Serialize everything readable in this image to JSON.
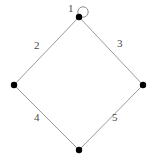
{
  "diagram": {
    "type": "graph",
    "title": "",
    "background_color": "#ffffff",
    "vertex_color": "#000000",
    "edge_color": "#9a9a9a",
    "label_color": "#4a4a4a",
    "shape": "diamond",
    "vertices": [
      {
        "id": "top",
        "name": "vertex-top",
        "x": 79,
        "y": 17,
        "radius": 3.2
      },
      {
        "id": "left",
        "name": "vertex-left",
        "x": 14,
        "y": 85,
        "radius": 3.2
      },
      {
        "id": "right",
        "name": "vertex-right",
        "x": 143,
        "y": 85,
        "radius": 3.2
      },
      {
        "id": "bottom",
        "name": "vertex-bottom",
        "x": 79,
        "y": 150,
        "radius": 3.2
      }
    ],
    "edges": [
      {
        "id": "e1",
        "name": "edge-self-loop-top",
        "from": "top",
        "to": "top",
        "kind": "loop",
        "cx": 83,
        "cy": 12,
        "r": 5.2
      },
      {
        "id": "e2",
        "name": "edge-top-left",
        "from": "top",
        "to": "left",
        "kind": "line"
      },
      {
        "id": "e3",
        "name": "edge-top-right",
        "from": "top",
        "to": "right",
        "kind": "line"
      },
      {
        "id": "e4",
        "name": "edge-left-bottom",
        "from": "left",
        "to": "bottom",
        "kind": "line"
      },
      {
        "id": "e5",
        "name": "edge-right-bottom",
        "from": "right",
        "to": "bottom",
        "kind": "line"
      }
    ],
    "labels": [
      {
        "id": "l1",
        "name": "edge-label-1",
        "text": "1",
        "x": 68,
        "y": 8,
        "for_edge": "e1"
      },
      {
        "id": "l2",
        "name": "edge-label-2",
        "text": "2",
        "x": 34,
        "y": 45,
        "for_edge": "e2"
      },
      {
        "id": "l3",
        "name": "edge-label-3",
        "text": "3",
        "x": 117,
        "y": 43,
        "for_edge": "e3"
      },
      {
        "id": "l4",
        "name": "edge-label-4",
        "text": "4",
        "x": 34,
        "y": 117,
        "for_edge": "e4"
      },
      {
        "id": "l5",
        "name": "edge-label-5",
        "text": "5",
        "x": 112,
        "y": 117,
        "for_edge": "e5"
      }
    ]
  }
}
